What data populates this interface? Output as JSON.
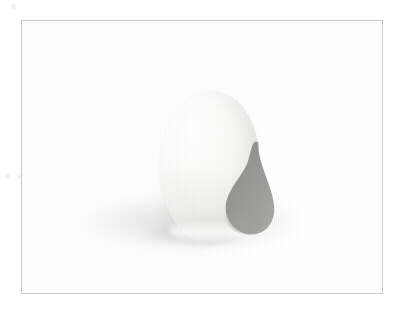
{
  "image": {
    "alt_text": "Photograph of a smooth white ceramic egg-shaped sculpture with a grey teardrop-shaped aperture on its right side, resting on a white surface with a soft cast shadow",
    "background_color": "#ffffff",
    "frame": {
      "border_color": "#c9c9c9",
      "border_width": "1px",
      "x": 21,
      "y": 20,
      "width": 362,
      "height": 274
    }
  },
  "subject": {
    "name": "ceramic-sculpture",
    "description": "rounded egg-like white ceramic form",
    "body_color_light": "#ffffff",
    "body_color_mid": "#f7f7f5",
    "body_color_shade": "#e8e8e5",
    "highlight_color": "#ffffff"
  },
  "teardrop": {
    "name": "teardrop-aperture",
    "description": "grey teardrop shape with narrow hooked tip at top and wide bulb at bottom",
    "fill_top": "#8f8f8d",
    "fill_mid": "#9b9b99",
    "fill_bottom": "#a7a7a4",
    "edge_color": "#868684"
  },
  "shadow": {
    "name": "cast-shadow",
    "ground_color": "rgba(150,150,148,0.34)",
    "contact_color": "rgba(140,140,138,0.40)"
  },
  "speckles": [
    {
      "name": "paper-speckle-top-left"
    },
    {
      "name": "paper-speckle-mid-left-a"
    },
    {
      "name": "paper-speckle-mid-left-b"
    }
  ]
}
